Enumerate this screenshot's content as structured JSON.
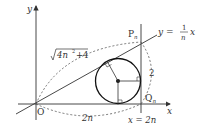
{
  "diagram": {
    "axes": {
      "x_label": "x",
      "y_label": "y",
      "origin_label": "O"
    },
    "points": {
      "P": {
        "name": "P",
        "subscript": "n"
      },
      "Q": {
        "name": "Q",
        "subscript": "n"
      }
    },
    "line_label": {
      "lhs": "y =",
      "frac_num": "1",
      "frac_den": "n",
      "rhs": "x"
    },
    "vertical_line_label": "x = 2n",
    "arc_labels": {
      "op_length": "4n",
      "op_length_exp": "2",
      "op_length_tail": "+4",
      "oq_length": "2n",
      "pq_length": "2"
    },
    "colors": {
      "stroke": "#333333",
      "dashed": "#555555",
      "background": "#ffffff"
    }
  }
}
